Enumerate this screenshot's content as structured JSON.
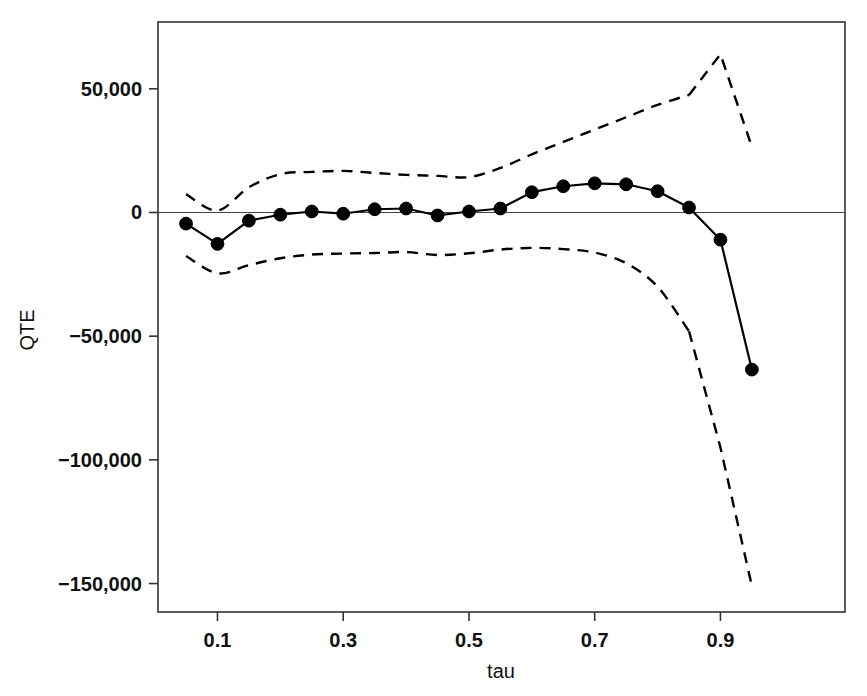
{
  "chart_data": {
    "type": "line",
    "title": "",
    "subtitle": "",
    "xlabel": "tau",
    "ylabel": "QTE",
    "xlim": [
      0.0054,
      1.0981
    ],
    "ylim": [
      -161500,
      77000
    ],
    "grid": false,
    "legend": null,
    "x_ticks": [
      0.1,
      0.3,
      0.5,
      0.7,
      0.9
    ],
    "x_tick_labels": [
      "0.1",
      "0.3",
      "0.5",
      "0.7",
      "0.9"
    ],
    "y_ticks": [
      50000,
      0,
      -50000,
      -100000,
      -150000
    ],
    "y_tick_labels": [
      "50,000",
      "0",
      "−50,000",
      "−100,000",
      "−150,000"
    ],
    "zero_reference_line": 0,
    "x": [
      0.05,
      0.1,
      0.15,
      0.2,
      0.25,
      0.3,
      0.35,
      0.4,
      0.45,
      0.5,
      0.55,
      0.6,
      0.65,
      0.7,
      0.75,
      0.8,
      0.85,
      0.9,
      0.95
    ],
    "series": [
      {
        "name": "QTE estimate",
        "style": "solid-with-markers",
        "marker": "filled-circle",
        "color": "#000000",
        "values": [
          -4500,
          -12700,
          -3300,
          -900,
          400,
          -500,
          1300,
          1600,
          -1200,
          400,
          1600,
          8200,
          10600,
          11800,
          11400,
          8600,
          2000,
          -11000,
          -63500
        ]
      },
      {
        "name": "upper confidence band",
        "style": "dashed",
        "color": "#000000",
        "values": [
          7400,
          800,
          10200,
          15500,
          16400,
          16800,
          16000,
          15200,
          14800,
          14300,
          18000,
          23500,
          28500,
          33500,
          38500,
          43500,
          47500,
          64000,
          26500
        ]
      },
      {
        "name": "lower confidence band",
        "style": "dashed",
        "color": "#000000",
        "values": [
          -17600,
          -24600,
          -21300,
          -18500,
          -17000,
          -16600,
          -16400,
          -16000,
          -17200,
          -16500,
          -15000,
          -14300,
          -14800,
          -16200,
          -20500,
          -30000,
          -48000,
          -95000,
          -151000
        ]
      }
    ]
  },
  "axes": {
    "x_axis_label": "tau",
    "y_axis_label": "QTE"
  }
}
